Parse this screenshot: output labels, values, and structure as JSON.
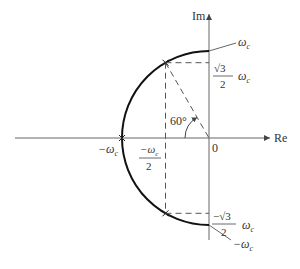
{
  "diagram": {
    "type": "complex-plane-semicircle",
    "axes": {
      "imag_label": "Im",
      "real_label": "Re",
      "origin_label": "0"
    },
    "angle_label": "60°",
    "points": {
      "top": {
        "label": "ω",
        "sub": "c"
      },
      "upper_sqrt": {
        "numer": "√3",
        "denom": "2",
        "omega": "ω",
        "sub": "c"
      },
      "left": {
        "label": "−ω",
        "sub": "c"
      },
      "half_left": {
        "numer": "−ω",
        "sub": "c",
        "denom": "2"
      },
      "lower_sqrt": {
        "numer": "−√3",
        "denom": "2",
        "omega": "ω",
        "sub": "c"
      },
      "bottom": {
        "label": "−ω",
        "sub": "c"
      }
    },
    "colors": {
      "axis": "#555555",
      "curve": "#111111",
      "dash": "#555555",
      "text": "#333333"
    }
  }
}
